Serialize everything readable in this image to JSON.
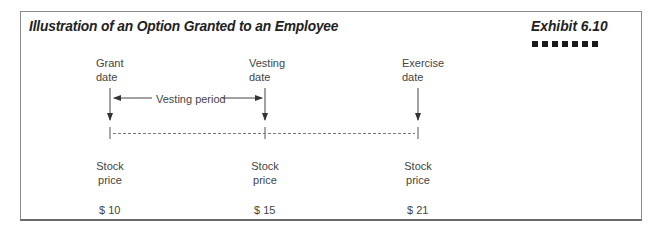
{
  "header": {
    "title": "Illustration of an Option Granted to an Employee",
    "exhibit": "Exhibit 6.10",
    "decoration": "seven-black-squares"
  },
  "timeline": {
    "events": [
      {
        "line1": "Grant",
        "line2": "date"
      },
      {
        "line1": "Vesting",
        "line2": "date"
      },
      {
        "line1": "Exercise",
        "line2": "date"
      }
    ],
    "period_label": "Vesting period",
    "stock_price_label": {
      "line1": "Stock",
      "line2": "price"
    },
    "prices": [
      "$ 10",
      "$ 15",
      "$ 21"
    ]
  },
  "colors": {
    "text": "#444444",
    "title": "#222222",
    "border": "#8a8a8a",
    "lines": "#444444"
  }
}
